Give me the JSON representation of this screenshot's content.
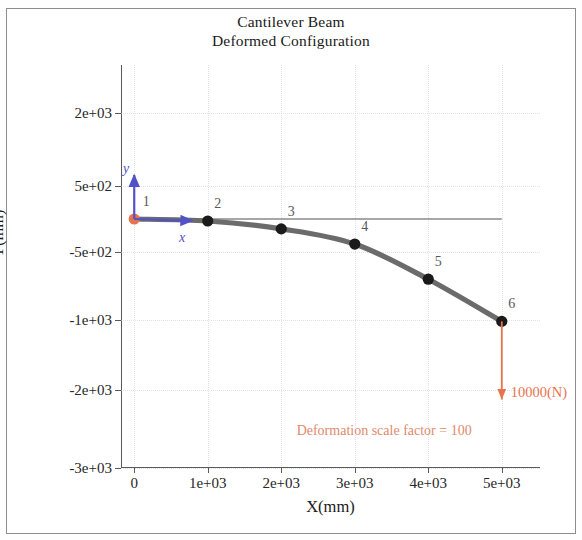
{
  "figure": {
    "title_line1": "Cantilever Beam",
    "title_line2": "Deformed Configuration",
    "border_color": "#8d8d8d",
    "background": "#ffffff"
  },
  "chart_data": {
    "type": "line",
    "title": "Cantilever Beam\nDeformed Configuration",
    "xlabel": "X(mm)",
    "ylabel": "Y(mm)",
    "grid": true,
    "legend": false,
    "x_ticks": [
      0,
      1000,
      2000,
      3000,
      4000,
      5000
    ],
    "x_ticklabels": [
      "0",
      "1e+03",
      "2e+03",
      "3e+03",
      "4e+03",
      "5e+03"
    ],
    "y_ticks": [
      2000,
      500,
      -500,
      -1000,
      -2000,
      -3000
    ],
    "y_ticklabels": [
      "2e+03",
      "5e+02",
      "-5e+02",
      "-1e+03",
      "-2e+03",
      "-3e+03"
    ],
    "xlim": [
      -180,
      5520
    ],
    "ylim": [
      -3000,
      2800
    ],
    "series": [
      {
        "name": "Deformed beam",
        "color": "#6b6b6b",
        "x": [
          0,
          1000,
          2000,
          3000,
          4000,
          5000
        ],
        "y": [
          0,
          -30,
          -150,
          -380,
          -700,
          -1020
        ]
      },
      {
        "name": "Undeformed beam (reference)",
        "color": "#8a8a8a",
        "x": [
          0,
          5000
        ],
        "y": [
          0,
          0
        ]
      }
    ],
    "nodes": [
      {
        "id": "1",
        "x": 0,
        "y": 0,
        "color": "#e8734f"
      },
      {
        "id": "2",
        "x": 1000,
        "y": -30,
        "color": "#1a1a1a"
      },
      {
        "id": "3",
        "x": 2000,
        "y": -150,
        "color": "#1a1a1a"
      },
      {
        "id": "4",
        "x": 3000,
        "y": -380,
        "color": "#1a1a1a"
      },
      {
        "id": "5",
        "x": 4000,
        "y": -700,
        "color": "#1a1a1a"
      },
      {
        "id": "6",
        "x": 5000,
        "y": -1020,
        "color": "#1a1a1a"
      }
    ],
    "annotations": {
      "local_axis_x_label": "x",
      "local_axis_y_label": "y",
      "local_axis_color": "#5252c8",
      "load_label": "10000(N)",
      "load_color": "#e8734f",
      "scale_note": "Deformation scale factor = 100",
      "scale_note_color": "#e08a6e"
    }
  }
}
